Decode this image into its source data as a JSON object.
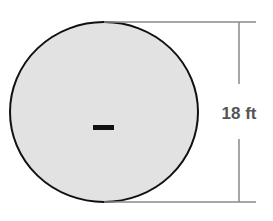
{
  "diagram": {
    "shape": "circle",
    "dimension_label": "18 ft",
    "center_mark": "dash",
    "colors": {
      "fill": "#e2e2e2",
      "outline": "#111111",
      "dimension_line": "#8a8a8a",
      "label": "#555555"
    }
  }
}
